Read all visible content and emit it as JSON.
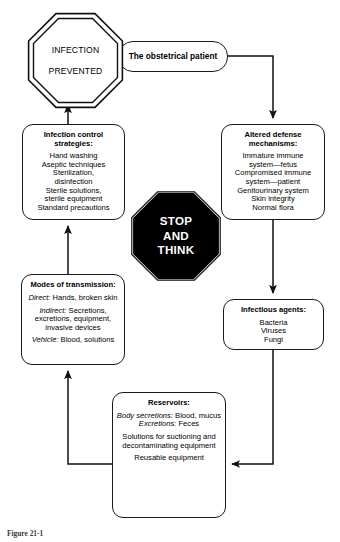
{
  "figure": {
    "caption": "Figure 21-1"
  },
  "nodes": {
    "infection_prevented": {
      "line1": "INFECTION",
      "line2": "PREVENTED",
      "shape": "double-octagon"
    },
    "stop_think": {
      "line1": "STOP",
      "line2": "AND",
      "line3": "THINK",
      "shape": "octagon",
      "fill": "#000000",
      "text_color": "#ffffff"
    },
    "obstetrical_patient": {
      "label": "The obstetrical patient"
    },
    "infection_control": {
      "title": "Infection control strategies:",
      "items": [
        "Hand washing",
        "Aseptic techniques",
        "Sterilization,",
        "disinfection",
        "Sterile solutions,",
        "sterile equipment",
        "Standard precautions"
      ]
    },
    "altered_defense": {
      "title": "Altered defense mechanisms:",
      "items": [
        "Immature immune",
        "system—fetus",
        "Compromised immune",
        "system—patient",
        "Genitourinary system",
        "Skin integrity",
        "Normal flora"
      ]
    },
    "modes_of_transmission": {
      "title": "Modes of transmission:",
      "groups": [
        {
          "lead": "Direct:",
          "text": " Hands, broken skin"
        },
        {
          "lead": "Indirect:",
          "text": " Secretions, excretions, equipment, invasive devices"
        },
        {
          "lead": "Vehicle:",
          "text": " Blood, solutions"
        }
      ]
    },
    "infectious_agents": {
      "title": "Infectious agents:",
      "items": [
        "Bacteria",
        "Viruses",
        "Fungi"
      ]
    },
    "reservoirs": {
      "title": "Reservoirs:",
      "groups": [
        {
          "lead": "Body secretions:",
          "text": " Blood, mucus"
        },
        {
          "lead": "Excretions:",
          "text": " Feces"
        }
      ],
      "block2": "Solutions for suctioning and decontaminating equipment",
      "block3": "Reusable equipment"
    }
  },
  "flow": {
    "edges": [
      {
        "from": "obstetrical_patient",
        "to": "altered_defense"
      },
      {
        "from": "altered_defense",
        "to": "infectious_agents"
      },
      {
        "from": "infectious_agents",
        "to": "reservoirs"
      },
      {
        "from": "reservoirs",
        "to": "modes_of_transmission"
      },
      {
        "from": "modes_of_transmission",
        "to": "infection_control"
      },
      {
        "from": "infection_control",
        "to": "infection_prevented"
      }
    ]
  },
  "colors": {
    "stroke": "#1a1a1a",
    "stop_fill": "#000000",
    "background": "#ffffff"
  }
}
